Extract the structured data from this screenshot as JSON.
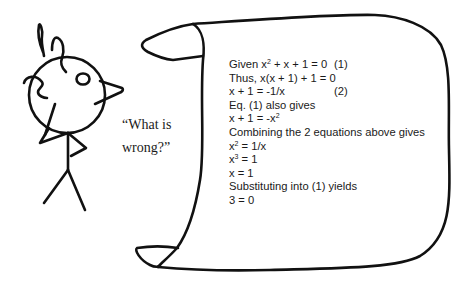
{
  "speech": {
    "line1": "“What is",
    "line2": "wrong?”"
  },
  "proof": {
    "lines": [
      {
        "pre": "Given x",
        "sup": "2",
        "post": " + x + 1 = 0",
        "ref": "(1)"
      },
      {
        "pre": "Thus, x(x + 1) + 1 = 0",
        "sup": "",
        "post": "",
        "ref": ""
      },
      {
        "pre": "x + 1 = -1/x",
        "sup": "",
        "post": "",
        "ref": "(2)"
      },
      {
        "pre": "Eq. (1) also gives",
        "sup": "",
        "post": "",
        "ref": ""
      },
      {
        "pre": "x + 1 = -x",
        "sup": "2",
        "post": "",
        "ref": ""
      },
      {
        "pre": "Combining the 2 equations above gives",
        "sup": "",
        "post": "",
        "ref": ""
      },
      {
        "pre": "x",
        "sup": "2",
        "post": " = 1/x",
        "ref": ""
      },
      {
        "pre": "x",
        "sup": "3",
        "post": " = 1",
        "ref": ""
      },
      {
        "pre": "x = 1",
        "sup": "",
        "post": "",
        "ref": ""
      },
      {
        "pre": "Substituting into (1) yields",
        "sup": "",
        "post": "",
        "ref": ""
      },
      {
        "pre": "3 = 0",
        "sup": "",
        "post": "",
        "ref": ""
      }
    ]
  },
  "colors": {
    "ink": "#111111",
    "text": "#1a1a1a",
    "background": "#ffffff"
  }
}
